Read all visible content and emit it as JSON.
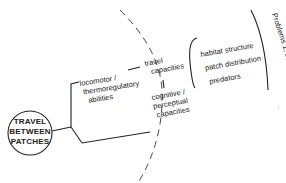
{
  "diagram": {
    "central_node": {
      "lines": [
        "TRAVEL",
        "BETWEEN",
        "PATCHES"
      ]
    },
    "abilities": {
      "locomotor": [
        "locomotor /",
        "thermoregulatory",
        "abilities"
      ],
      "travel_capacities": [
        "travel",
        "capacities"
      ],
      "cognitive": [
        "cognitive /",
        "perceptual",
        "capacities"
      ]
    },
    "factors": {
      "items": [
        "habitat structure",
        "patch distribution",
        "predators"
      ]
    },
    "problems_label": "Problems 1, 2, 3",
    "colors": {
      "ink": "#222222",
      "background": "#ffffff"
    }
  }
}
